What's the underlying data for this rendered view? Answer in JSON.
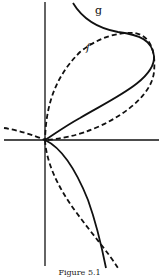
{
  "figure": {
    "caption": "Figure 5.1",
    "curves": [
      {
        "label": "g",
        "style": "solid",
        "color": "#111111"
      },
      {
        "label": "f",
        "style": "dashed",
        "color": "#111111"
      }
    ],
    "axes": {
      "x_axis": true,
      "y_axis": true,
      "color": "#111111"
    }
  }
}
